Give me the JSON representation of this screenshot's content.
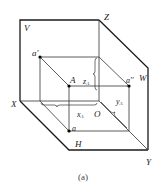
{
  "diagram": {
    "labels": {
      "V": "V",
      "Z": "Z",
      "W": "W",
      "X": "X",
      "H": "H",
      "Y": "Y",
      "O": "O",
      "A": "A",
      "a_prime": "a'",
      "a_dprime": "a''",
      "a": "a",
      "zA": "z",
      "zA_sub": "A",
      "xA": "x",
      "xA_sub": "A",
      "yA": "y",
      "yA_sub": "A"
    },
    "caption": "(a)",
    "colors": {
      "line": "#1a1a1a",
      "thin": "#333333",
      "point": "#000000"
    }
  }
}
